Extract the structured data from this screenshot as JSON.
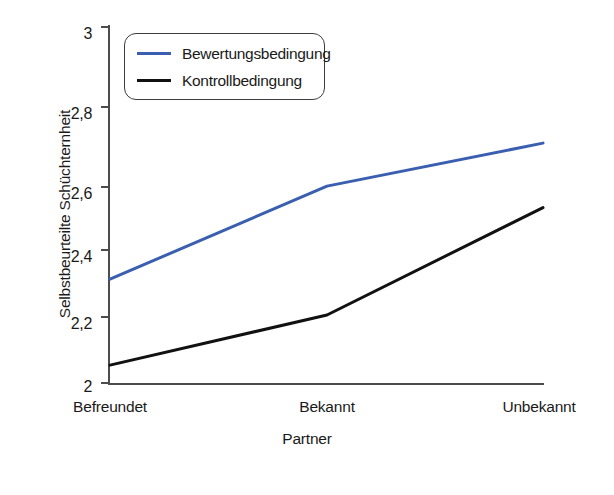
{
  "chart_data": {
    "type": "line",
    "title": "",
    "xlabel": "Partner",
    "ylabel": "Selbstbeurteilte Schüchternheit",
    "categories": [
      "Befreundet",
      "Bekannt",
      "Unbekannt"
    ],
    "ylim": [
      2,
      3
    ],
    "yticks": [
      "2",
      "2,2",
      "2,4",
      "2,6",
      "2,8",
      "3"
    ],
    "ytick_values": [
      2,
      2.2,
      2.4,
      2.6,
      2.8,
      3
    ],
    "grid": false,
    "legend_position": "top-left",
    "series": [
      {
        "name": "Bewertungsbedingung",
        "color": "#3a5fb0",
        "values": [
          2.29,
          2.55,
          2.67
        ]
      },
      {
        "name": "Kontrollbedingung",
        "color": "#111111",
        "values": [
          2.05,
          2.19,
          2.49
        ]
      }
    ]
  },
  "legend": {
    "items": [
      {
        "label": "Bewertungsbedingung",
        "swatch": "blue-line-swatch"
      },
      {
        "label": "Kontrollbedingung",
        "swatch": "black-line-swatch"
      }
    ]
  },
  "axes": {
    "y_title": "Selbstbeurteilte Schüchternheit",
    "x_title": "Partner",
    "y_ticks": [
      "3",
      "2,8",
      "2,6",
      "2,4",
      "2,2",
      "2"
    ],
    "x_ticks": [
      "Befreundet",
      "Bekannt",
      "Unbekannt"
    ]
  }
}
